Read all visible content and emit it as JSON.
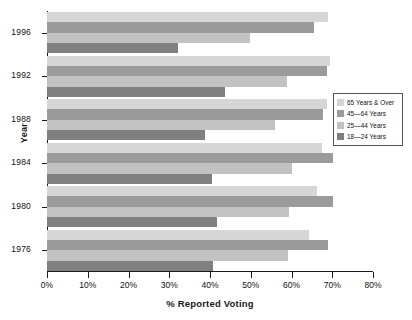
{
  "chart_data": {
    "type": "bar",
    "orientation": "horizontal",
    "title": "",
    "xlabel": "% Reported Voting",
    "ylabel": "Year",
    "categories": [
      "1976",
      "1980",
      "1984",
      "1988",
      "1992",
      "1996"
    ],
    "xlim": [
      0,
      80
    ],
    "xticks": [
      0,
      10,
      20,
      30,
      40,
      50,
      60,
      70,
      80
    ],
    "xtick_labels": [
      "0%",
      "10%",
      "20%",
      "30%",
      "40%",
      "50%",
      "60%",
      "70%",
      "80%"
    ],
    "grid": false,
    "legend_position": "right",
    "series": [
      {
        "name": "65 Years & Over",
        "color": "#d6d6d6",
        "values": [
          64.2,
          66.2,
          67.4,
          68.6,
          69.4,
          68.9
        ]
      },
      {
        "name": "45—64 Years",
        "color": "#9b9b9b",
        "values": [
          68.9,
          70.1,
          70.1,
          67.7,
          68.6,
          65.4
        ]
      },
      {
        "name": "25—44 Years",
        "color": "#c2c2c2",
        "values": [
          59.1,
          59.3,
          60.0,
          55.9,
          58.8,
          49.8
        ]
      },
      {
        "name": "18—24 Years",
        "color": "#808080",
        "values": [
          40.7,
          41.6,
          40.4,
          38.7,
          43.6,
          32.1
        ]
      }
    ]
  },
  "legend": {
    "items": [
      {
        "label": "65 Years & Over",
        "color": "#d6d6d6"
      },
      {
        "label": "45—64 Years",
        "color": "#9b9b9b"
      },
      {
        "label": "25—44 Years",
        "color": "#c2c2c2"
      },
      {
        "label": "18—24 Years",
        "color": "#808080"
      }
    ]
  }
}
